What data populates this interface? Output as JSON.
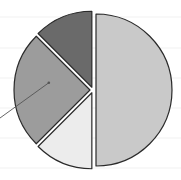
{
  "chart_data": {
    "type": "pie",
    "title": "",
    "exploded": true,
    "start_angle_deg": 0,
    "direction": "clockwise",
    "slices": [
      {
        "label": "",
        "value": 50,
        "color": "#c9c9c9"
      },
      {
        "label": "",
        "value": 12.5,
        "color": "#ececec"
      },
      {
        "label": "",
        "value": 25,
        "color": "#9c9c9c"
      },
      {
        "label": "",
        "value": 12.5,
        "color": "#6a6a6a"
      }
    ],
    "values": [
      50,
      12.5,
      25,
      12.5
    ],
    "annotations": [
      {
        "type": "leader-line",
        "target_slice": 2,
        "text": ""
      }
    ],
    "grid": true,
    "legend": null
  },
  "style": {
    "outline_color": "#2a2a2a",
    "gap_color": "#ffffff",
    "grid_color": "#f1f1f1",
    "leader_color": "#555555"
  }
}
